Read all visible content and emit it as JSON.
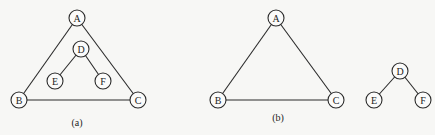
{
  "diagrams": [
    {
      "id": "a",
      "caption": "(a)",
      "caption_pos": [
        77,
        126
      ],
      "nodes": [
        {
          "id": "A",
          "label": "A",
          "x": 77,
          "y": 18
        },
        {
          "id": "D",
          "label": "D",
          "x": 81,
          "y": 49
        },
        {
          "id": "E",
          "label": "E",
          "x": 55,
          "y": 81
        },
        {
          "id": "F",
          "label": "F",
          "x": 103,
          "y": 81
        },
        {
          "id": "B",
          "label": "B",
          "x": 19,
          "y": 100
        },
        {
          "id": "C",
          "label": "C",
          "x": 138,
          "y": 100
        }
      ],
      "edges": [
        [
          "A",
          "B"
        ],
        [
          "A",
          "C"
        ],
        [
          "B",
          "C"
        ],
        [
          "D",
          "E"
        ],
        [
          "D",
          "F"
        ]
      ]
    },
    {
      "id": "b",
      "caption": "(b)",
      "caption_pos": [
        278,
        121
      ],
      "nodes": [
        {
          "id": "A",
          "label": "A",
          "x": 276,
          "y": 18
        },
        {
          "id": "B",
          "label": "B",
          "x": 218,
          "y": 100
        },
        {
          "id": "C",
          "label": "C",
          "x": 336,
          "y": 100
        },
        {
          "id": "D",
          "label": "D",
          "x": 400,
          "y": 71
        },
        {
          "id": "E",
          "label": "E",
          "x": 374,
          "y": 100
        },
        {
          "id": "F",
          "label": "F",
          "x": 423,
          "y": 100
        }
      ],
      "edges": [
        [
          "A",
          "B"
        ],
        [
          "A",
          "C"
        ],
        [
          "B",
          "C"
        ],
        [
          "D",
          "E"
        ],
        [
          "D",
          "F"
        ]
      ]
    }
  ],
  "style": {
    "node_radius": 8,
    "stroke_color": "#2a2a2a",
    "background": "#f7f7f5"
  }
}
